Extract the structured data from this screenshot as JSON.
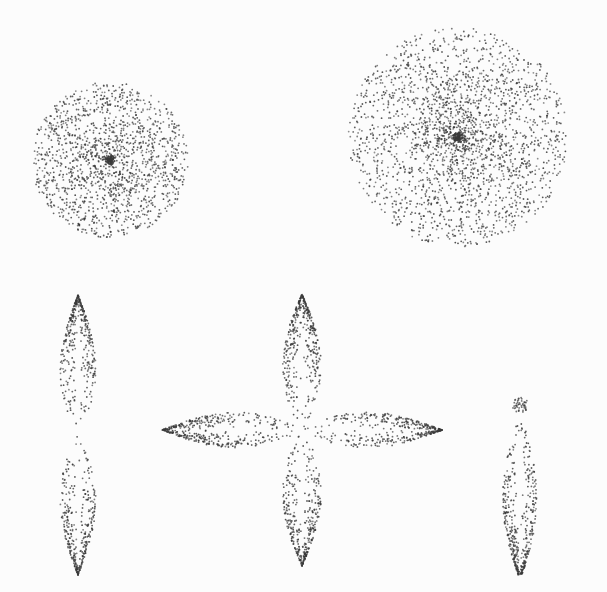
{
  "figure": {
    "background": "#fcfcfc",
    "dot_color": "#3a3a3a",
    "orbitals": [
      {
        "name": "s-orbital-small",
        "type": "sphere",
        "cx": 110,
        "cy": 160,
        "r": 78,
        "dots": 1500,
        "core": 1.6
      },
      {
        "name": "s-orbital-large",
        "type": "sphere",
        "cx": 458,
        "cy": 137,
        "r": 110,
        "dots": 2300,
        "core": 1.3
      },
      {
        "name": "p-orbital-vertical",
        "type": "dumbbell",
        "cx": 78,
        "cy": 435,
        "angle": 90,
        "len": 140,
        "w": 24,
        "dots": 700
      },
      {
        "name": "d-orbital-cloverleaf-v",
        "type": "dumbbell",
        "cx": 302,
        "cy": 430,
        "angle": 90,
        "len": 136,
        "w": 26,
        "dots": 750
      },
      {
        "name": "d-orbital-cloverleaf-h",
        "type": "dumbbell",
        "cx": 302,
        "cy": 430,
        "angle": 0,
        "len": 140,
        "w": 24,
        "dots": 750
      },
      {
        "name": "p-orbital-asymmetric",
        "type": "drop",
        "cx": 520,
        "cy": 405,
        "len": 160,
        "w": 28,
        "knob": 8,
        "dots": 420
      }
    ]
  }
}
